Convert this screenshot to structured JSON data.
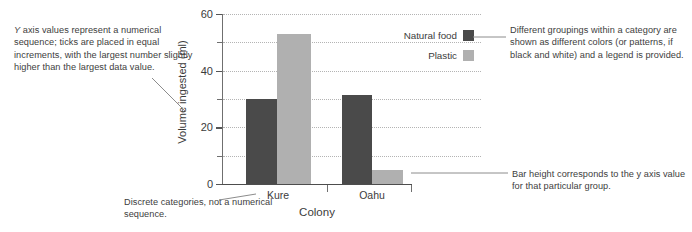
{
  "chart_data": {
    "type": "bar",
    "title": "",
    "xlabel": "Colony",
    "ylabel": "Volume ingested (ml)",
    "categories": [
      "Kure",
      "Oahu"
    ],
    "series": [
      {
        "name": "Natural food",
        "color": "#4a4a4a",
        "values": [
          30,
          31.5
        ]
      },
      {
        "name": "Plastic",
        "color": "#b0b0b0",
        "values": [
          53,
          5
        ]
      }
    ],
    "ylim": [
      0,
      60
    ],
    "major_ticks": [
      0,
      20,
      40,
      60
    ],
    "minor_ticks": [
      10,
      30,
      50
    ],
    "tick_labels": [
      "0",
      "20",
      "40",
      "60"
    ],
    "grid": true,
    "grid_style": "dotted",
    "legend_position": "top-right-outside"
  },
  "legend": {
    "items": [
      {
        "label": "Natural food",
        "color": "#4a4a4a"
      },
      {
        "label": "Plastic",
        "color": "#b0b0b0"
      }
    ]
  },
  "annotations": {
    "y_axis_note": "Y axis values represent a numerical sequence; ticks are placed in equal increments, with the largest number slightly higher than the largest data value.",
    "y_axis_note_lead": "Y",
    "y_axis_note_rest": " axis values represent a numerical sequence; ticks are placed in equal increments, with the largest number slightly higher than the largest data value.",
    "x_axis_note": "Discrete categories, not a numerical sequence.",
    "legend_note": "Different groupings within a category are shown as different colors (or patterns, if black and white) and a legend is provided.",
    "bar_note": "Bar height corresponds to the y axis value for that particular group."
  },
  "axis": {
    "y_label": "Volume ingested (ml)",
    "x_label": "Colony",
    "y_ticks": [
      "60",
      "40",
      "20",
      "0"
    ],
    "x_categories": [
      "Kure",
      "Oahu"
    ]
  },
  "colors": {
    "natural_food": "#4a4a4a",
    "plastic": "#b0b0b0",
    "axis": "#6f6f6f",
    "grid": "#b4b4b4",
    "text": "#3b3b3b",
    "leader": "#8c8c8c"
  }
}
